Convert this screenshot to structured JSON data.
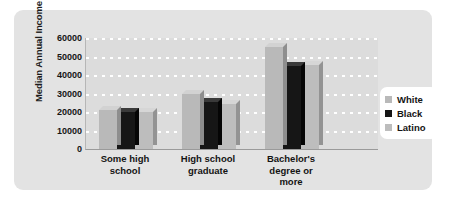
{
  "chart_data": {
    "type": "bar",
    "title": "",
    "xlabel": "",
    "ylabel": "Median Annual Income",
    "categories": [
      "Some high school",
      "High school graduate",
      "Bachelor's degree or more"
    ],
    "series": [
      {
        "name": "White",
        "color": "#b9b9b9",
        "values": [
          21000,
          30000,
          55000
        ]
      },
      {
        "name": "Black",
        "color": "#161616",
        "values": [
          20000,
          25500,
          45000
        ]
      },
      {
        "name": "Latino",
        "color": "#bdbdbd",
        "values": [
          20000,
          24500,
          45500
        ]
      }
    ],
    "ylim": [
      0,
      60000
    ],
    "yticks": [
      0,
      10000,
      20000,
      30000,
      40000,
      50000,
      60000
    ],
    "ytick_labels": [
      "0",
      "10000",
      "20000",
      "30000",
      "40000",
      "50000",
      "60000"
    ],
    "grid": true,
    "grid_axis": "y",
    "grid_style": "dotted-white",
    "legend_position": "right",
    "bar_style": "3d"
  },
  "legend": {
    "items": [
      {
        "label": "White"
      },
      {
        "label": "Black"
      },
      {
        "label": "Latino"
      }
    ]
  },
  "colors": {
    "page_background": "#ffffff",
    "panel_background": "#e3e3e3",
    "plot_background": "#dcdcdc",
    "gridline": "#ffffff",
    "legend_background": "#ffffff",
    "text": "#141414"
  }
}
